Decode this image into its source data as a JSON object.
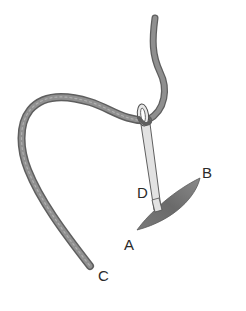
{
  "diagram": {
    "labels": {
      "A": "A",
      "B": "B",
      "C": "C",
      "D": "D"
    },
    "colors": {
      "thread": "#8a8a8a",
      "thread_dark": "#5e5e5e",
      "needle": "#d8d8d8",
      "needle_outline": "#555555",
      "fabric": "#6f6f6f",
      "label": "#2a2a2a",
      "background": "#ffffff"
    }
  }
}
